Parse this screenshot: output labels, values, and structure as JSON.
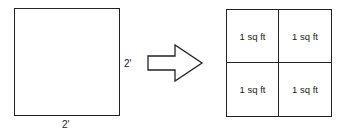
{
  "diagram": {
    "original_square": {
      "side_label_right": "2'",
      "side_label_bottom": "2'"
    },
    "arrow": {
      "direction": "right",
      "style": "hollow-block-arrow"
    },
    "divided_square": {
      "cells": [
        {
          "label": "1 sq ft"
        },
        {
          "label": "1 sq ft"
        },
        {
          "label": "1 sq ft"
        },
        {
          "label": "1 sq ft"
        }
      ]
    },
    "colors": {
      "stroke": "#222222",
      "background": "#ffffff"
    }
  }
}
